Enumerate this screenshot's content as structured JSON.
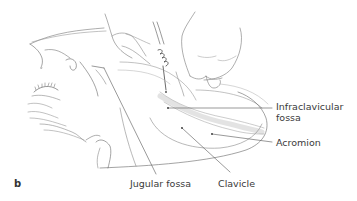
{
  "figure": {
    "panel_letter": "b",
    "labels": {
      "infraclavicular_line1": "Infraclavicular",
      "infraclavicular_line2": "fossa",
      "acromion": "Acromion",
      "jugular_fossa": "Jugular fossa",
      "clavicle": "Clavicle"
    }
  }
}
